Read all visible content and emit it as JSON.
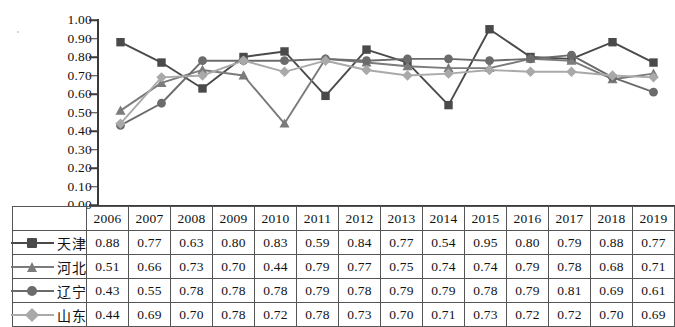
{
  "chart_data": {
    "type": "line",
    "title": "",
    "xlabel": "",
    "ylabel": "",
    "ylim": [
      0.0,
      1.0
    ],
    "ytick_step": 0.1,
    "grid": false,
    "legend_position": "table-row-labels",
    "categories": [
      "2006",
      "2007",
      "2008",
      "2009",
      "2010",
      "2011",
      "2012",
      "2013",
      "2014",
      "2015",
      "2016",
      "2017",
      "2018",
      "2019"
    ],
    "series": [
      {
        "name": "天津",
        "marker": "square",
        "color": "#4a4a4a",
        "values": [
          0.88,
          0.77,
          0.63,
          0.8,
          0.83,
          0.59,
          0.84,
          0.77,
          0.54,
          0.95,
          0.8,
          0.79,
          0.88,
          0.77
        ]
      },
      {
        "name": "河北",
        "marker": "triangle",
        "color": "#7b7b7b",
        "values": [
          0.51,
          0.66,
          0.73,
          0.7,
          0.44,
          0.79,
          0.77,
          0.75,
          0.74,
          0.74,
          0.79,
          0.78,
          0.68,
          0.71
        ]
      },
      {
        "name": "辽宁",
        "marker": "circle",
        "color": "#6b6b6b",
        "values": [
          0.43,
          0.55,
          0.78,
          0.78,
          0.78,
          0.79,
          0.78,
          0.79,
          0.79,
          0.78,
          0.79,
          0.81,
          0.69,
          0.61
        ]
      },
      {
        "name": "山东",
        "marker": "diamond",
        "color": "#a9a9a9",
        "values": [
          0.44,
          0.69,
          0.7,
          0.78,
          0.72,
          0.78,
          0.73,
          0.7,
          0.71,
          0.73,
          0.72,
          0.72,
          0.7,
          0.69
        ]
      }
    ]
  },
  "axis": {
    "ytick_labels": [
      "1.00",
      "0.90",
      "0.80",
      "0.70",
      "0.60",
      "0.50",
      "0.40",
      "0.30",
      "0.20",
      "0.10",
      "0.00"
    ]
  },
  "table": {
    "year_headers": [
      "2006",
      "2007",
      "2008",
      "2009",
      "2010",
      "2011",
      "2012",
      "2013",
      "2014",
      "2015",
      "2016",
      "2017",
      "2018",
      "2019"
    ],
    "rows": [
      {
        "label": "天津",
        "values": [
          "0.88",
          "0.77",
          "0.63",
          "0.80",
          "0.83",
          "0.59",
          "0.84",
          "0.77",
          "0.54",
          "0.95",
          "0.80",
          "0.79",
          "0.88",
          "0.77"
        ]
      },
      {
        "label": "河北",
        "values": [
          "0.51",
          "0.66",
          "0.73",
          "0.70",
          "0.44",
          "0.79",
          "0.77",
          "0.75",
          "0.74",
          "0.74",
          "0.79",
          "0.78",
          "0.68",
          "0.71"
        ]
      },
      {
        "label": "辽宁",
        "values": [
          "0.43",
          "0.55",
          "0.78",
          "0.78",
          "0.78",
          "0.79",
          "0.78",
          "0.79",
          "0.79",
          "0.78",
          "0.79",
          "0.81",
          "0.69",
          "0.61"
        ]
      },
      {
        "label": "山东",
        "values": [
          "0.44",
          "0.69",
          "0.70",
          "0.78",
          "0.72",
          "0.78",
          "0.73",
          "0.70",
          "0.71",
          "0.73",
          "0.72",
          "0.72",
          "0.70",
          "0.69"
        ]
      }
    ]
  }
}
